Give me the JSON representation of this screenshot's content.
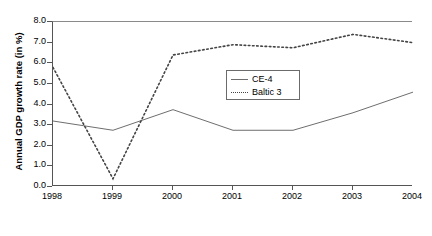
{
  "chart_data": {
    "type": "line",
    "title": "",
    "subtitle": "",
    "xlabel": "",
    "ylabel": "Annual GDP growth rate (in %)",
    "categories": [
      "1998",
      "1999",
      "2000",
      "2001",
      "2002",
      "2003",
      "2004"
    ],
    "x": [
      1998,
      1999,
      2000,
      2001,
      2002,
      2003,
      2004
    ],
    "xlim": [
      1998,
      2004
    ],
    "ylim": [
      0.0,
      8.0
    ],
    "ytick_labels": [
      "8.0",
      "7.0",
      "6.0",
      "5.0",
      "4.0",
      "3.0",
      "2.0",
      "1.0",
      "0.0"
    ],
    "ytick_values": [
      8.0,
      7.0,
      6.0,
      5.0,
      4.0,
      3.0,
      2.0,
      1.0,
      0.0
    ],
    "ystep": 1.0,
    "grid": false,
    "legend_position": "center",
    "series": [
      {
        "name": "CE-4",
        "style": "solid",
        "color": "#6e6e6e",
        "values": [
          3.2,
          2.75,
          3.75,
          2.75,
          2.75,
          3.6,
          4.6
        ]
      },
      {
        "name": "Baltic 3",
        "style": "dotted",
        "color": "#444444",
        "values": [
          5.8,
          0.4,
          6.4,
          6.9,
          6.75,
          7.4,
          7.0
        ]
      }
    ],
    "legend": [
      {
        "label": "CE-4",
        "style": "solid"
      },
      {
        "label": "Baltic 3",
        "style": "dotted"
      }
    ]
  }
}
